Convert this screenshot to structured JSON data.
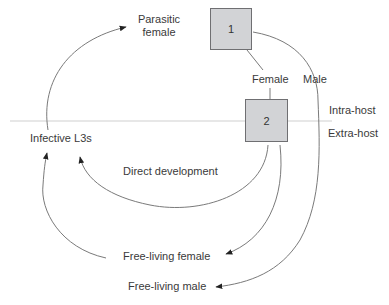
{
  "diagram": {
    "title": "",
    "nodes": {
      "parasitic_female": {
        "label_line1": "Parasitic",
        "label_line2": "female"
      },
      "box1": {
        "label": "1"
      },
      "box2": {
        "label": "2"
      },
      "infective_l3s": {
        "label": "Infective L3s"
      },
      "free_living_female": {
        "label": "Free-living female"
      },
      "free_living_male": {
        "label": "Free-living male"
      }
    },
    "edges": {
      "female": {
        "label": "Female"
      },
      "male": {
        "label": "Male"
      },
      "direct_development": {
        "label": "Direct development"
      }
    },
    "zones": {
      "intra_host": {
        "label": "Intra-host"
      },
      "extra_host": {
        "label": "Extra-host"
      }
    },
    "colors": {
      "box_fill": "#d2d3d6",
      "box_border": "#6f6f72",
      "line": "#7a7a7a",
      "divider": "#cfcfcf",
      "arrowhead": "#222222"
    }
  }
}
